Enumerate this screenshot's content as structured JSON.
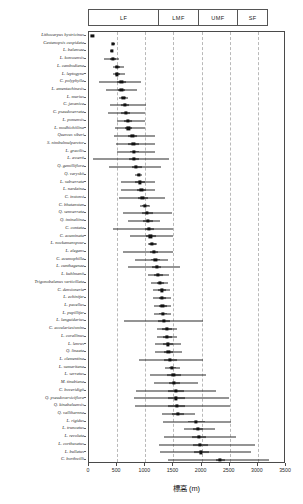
{
  "chart_data": {
    "type": "bar",
    "title": "",
    "xlabel": "標高 (m)",
    "ylabel": "",
    "xlim": [
      0,
      3500
    ],
    "xticks": [
      0,
      500,
      1000,
      1500,
      2000,
      2500,
      3000,
      3500
    ],
    "xtick_labels": [
      "0",
      "500",
      "1000",
      "1500",
      "2000",
      "2500",
      "3000",
      "3500"
    ],
    "gridlines": [
      500,
      1000,
      1500,
      2000,
      2500,
      3000
    ],
    "grid": true,
    "legend_position": "top",
    "orientation": "horizontal",
    "zone_bands": [
      {
        "label": "LF",
        "start": 0,
        "end": 1250
      },
      {
        "label": "LMF",
        "start": 1250,
        "end": 1950
      },
      {
        "label": "UMF",
        "start": 1950,
        "end": 2650
      },
      {
        "label": "SF",
        "start": 2650,
        "end": 3200
      }
    ],
    "series_note": "per-species elevation distribution: point = median, thick bar = interquartile range, thin line = full range",
    "categories": [
      "Lithocarpus hystricinus",
      "Castanopsis cuspidata",
      "L. balansae",
      "L. konsoensis",
      "L. cambodiana",
      "L. leptogyne",
      "C. polyphylla",
      "L. amentachinesis",
      "L. murius",
      "C. javanica",
      "C. pseudoserrata",
      "L. pomensis",
      "L. modhichiilina",
      "Quercus siberi",
      "S. nimbulmulparctor",
      "L. gracilis",
      "L. asserti",
      "Q. gemilliflora",
      "Q. varyskii",
      "L. subserrata",
      "L. nardaina",
      "C. instonsi",
      "C. bhutanstan",
      "Q. semserrata",
      "Q. iminaliina",
      "C. contata",
      "C. acuminata",
      "L. nockamanspour",
      "L. elegans",
      "C. acumophilla",
      "L. cunthagenae",
      "L. kuhlmanii",
      "Trigonobalanus verticillata",
      "C. densioneria",
      "L. echinifer",
      "L. pacellus",
      "L. pupillifer",
      "L. languidarius",
      "C. acculariasismim",
      "L. corallinus",
      "L. lenrus",
      "Q. lineata",
      "L. clementina",
      "L. sumaritana",
      "L. serratus",
      "M. tinubiana",
      "C. boveridigii",
      "Q. pseudoversiciflora",
      "Q. kinabaluensis",
      "Q. valliharnna",
      "L. rigidus",
      "L. truncatus",
      "L. revoluta",
      "L. corthusatus",
      "L. bullatus",
      "C. borthwilli"
    ],
    "values": [
      {
        "median": 60,
        "q1": 55,
        "q3": 68,
        "min": 50,
        "max": 75
      },
      {
        "median": 430,
        "q1": 410,
        "q3": 455,
        "min": 400,
        "max": 470
      },
      {
        "median": 400,
        "q1": 385,
        "q3": 420,
        "min": 375,
        "max": 430
      },
      {
        "median": 430,
        "q1": 380,
        "q3": 480,
        "min": 260,
        "max": 540
      },
      {
        "median": 500,
        "q1": 460,
        "q3": 545,
        "min": 420,
        "max": 620
      },
      {
        "median": 500,
        "q1": 465,
        "q3": 550,
        "min": 430,
        "max": 640
      },
      {
        "median": 575,
        "q1": 500,
        "q3": 660,
        "min": 170,
        "max": 930
      },
      {
        "median": 575,
        "q1": 520,
        "q3": 640,
        "min": 300,
        "max": 860
      },
      {
        "median": 610,
        "q1": 565,
        "q3": 660,
        "min": 530,
        "max": 700
      },
      {
        "median": 640,
        "q1": 570,
        "q3": 710,
        "min": 380,
        "max": 1010
      },
      {
        "median": 650,
        "q1": 575,
        "q3": 730,
        "min": 345,
        "max": 1000
      },
      {
        "median": 690,
        "q1": 620,
        "q3": 760,
        "min": 500,
        "max": 1000
      },
      {
        "median": 700,
        "q1": 640,
        "q3": 770,
        "min": 470,
        "max": 1000
      },
      {
        "median": 770,
        "q1": 690,
        "q3": 860,
        "min": 450,
        "max": 1170
      },
      {
        "median": 790,
        "q1": 700,
        "q3": 890,
        "min": 480,
        "max": 1180
      },
      {
        "median": 800,
        "q1": 720,
        "q3": 895,
        "min": 500,
        "max": 1170
      },
      {
        "median": 800,
        "q1": 715,
        "q3": 890,
        "min": 70,
        "max": 1420
      },
      {
        "median": 840,
        "q1": 760,
        "q3": 935,
        "min": 350,
        "max": 1280
      },
      {
        "median": 880,
        "q1": 845,
        "q3": 915,
        "min": 820,
        "max": 940
      },
      {
        "median": 900,
        "q1": 820,
        "q3": 1000,
        "min": 560,
        "max": 1180
      },
      {
        "median": 930,
        "q1": 850,
        "q3": 1020,
        "min": 560,
        "max": 1180
      },
      {
        "median": 950,
        "q1": 865,
        "q3": 1050,
        "min": 530,
        "max": 1350
      },
      {
        "median": 990,
        "q1": 935,
        "q3": 1060,
        "min": 910,
        "max": 1080
      },
      {
        "median": 1030,
        "q1": 940,
        "q3": 1140,
        "min": 600,
        "max": 1480
      },
      {
        "median": 1040,
        "q1": 960,
        "q3": 1140,
        "min": 700,
        "max": 1260
      },
      {
        "median": 1060,
        "q1": 990,
        "q3": 1150,
        "min": 430,
        "max": 1500
      },
      {
        "median": 1090,
        "q1": 1010,
        "q3": 1190,
        "min": 720,
        "max": 1490
      },
      {
        "median": 1120,
        "q1": 1070,
        "q3": 1185,
        "min": 1050,
        "max": 1210
      },
      {
        "median": 1150,
        "q1": 1080,
        "q3": 1230,
        "min": 600,
        "max": 1500
      },
      {
        "median": 1180,
        "q1": 1110,
        "q3": 1260,
        "min": 820,
        "max": 1400
      },
      {
        "median": 1200,
        "q1": 1125,
        "q3": 1280,
        "min": 700,
        "max": 1620
      },
      {
        "median": 1230,
        "q1": 1160,
        "q3": 1320,
        "min": 1050,
        "max": 1430
      },
      {
        "median": 1260,
        "q1": 1200,
        "q3": 1330,
        "min": 1110,
        "max": 1410
      },
      {
        "median": 1290,
        "q1": 1230,
        "q3": 1360,
        "min": 1130,
        "max": 1440
      },
      {
        "median": 1300,
        "q1": 1235,
        "q3": 1375,
        "min": 1140,
        "max": 1450
      },
      {
        "median": 1305,
        "q1": 1240,
        "q3": 1380,
        "min": 1150,
        "max": 1450
      },
      {
        "median": 1310,
        "q1": 1245,
        "q3": 1390,
        "min": 1160,
        "max": 1460
      },
      {
        "median": 1330,
        "q1": 1230,
        "q3": 1440,
        "min": 620,
        "max": 2020
      },
      {
        "median": 1380,
        "q1": 1300,
        "q3": 1470,
        "min": 1200,
        "max": 1560
      },
      {
        "median": 1390,
        "q1": 1310,
        "q3": 1480,
        "min": 1210,
        "max": 1570
      },
      {
        "median": 1400,
        "q1": 1320,
        "q3": 1490,
        "min": 1170,
        "max": 1640
      },
      {
        "median": 1410,
        "q1": 1330,
        "q3": 1500,
        "min": 1180,
        "max": 1650
      },
      {
        "median": 1440,
        "q1": 1330,
        "q3": 1560,
        "min": 880,
        "max": 2020
      },
      {
        "median": 1480,
        "q1": 1420,
        "q3": 1550,
        "min": 1350,
        "max": 1620
      },
      {
        "median": 1500,
        "q1": 1390,
        "q3": 1630,
        "min": 1090,
        "max": 2070
      },
      {
        "median": 1510,
        "q1": 1420,
        "q3": 1620,
        "min": 1150,
        "max": 1930
      },
      {
        "median": 1540,
        "q1": 1400,
        "q3": 1690,
        "min": 830,
        "max": 2250
      },
      {
        "median": 1550,
        "q1": 1400,
        "q3": 1700,
        "min": 800,
        "max": 2480
      },
      {
        "median": 1560,
        "q1": 1410,
        "q3": 1710,
        "min": 810,
        "max": 2500
      },
      {
        "median": 1580,
        "q1": 1470,
        "q3": 1690,
        "min": 1290,
        "max": 1890
      },
      {
        "median": 1900,
        "q1": 1760,
        "q3": 2060,
        "min": 1320,
        "max": 2530
      },
      {
        "median": 1930,
        "q1": 1840,
        "q3": 2030,
        "min": 1680,
        "max": 2240
      },
      {
        "median": 1950,
        "q1": 1830,
        "q3": 2080,
        "min": 1340,
        "max": 2620
      },
      {
        "median": 1970,
        "q1": 1840,
        "q3": 2110,
        "min": 1250,
        "max": 2950
      },
      {
        "median": 1990,
        "q1": 1860,
        "q3": 2130,
        "min": 1260,
        "max": 2880
      },
      {
        "median": 2330,
        "q1": 2260,
        "q3": 2410,
        "min": 1400,
        "max": 3200
      }
    ]
  }
}
